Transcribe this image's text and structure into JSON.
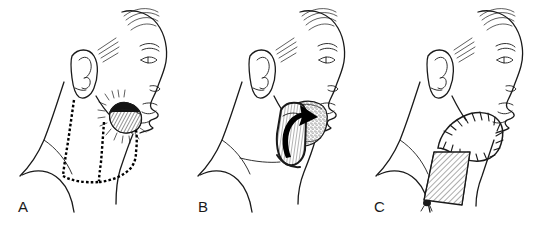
{
  "figure": {
    "type": "line-drawing-surgical-illustration",
    "background_color": "#ffffff",
    "ink_color": "#1a1a1a",
    "width_px": 545,
    "height_px": 236,
    "panel_count": 3,
    "view": "right lateral profile of head and neck"
  },
  "panels": [
    {
      "id": "A",
      "label": "A",
      "label_x": 18,
      "label_y": 212,
      "caption": "Cheek defect with planned cervicofacial flap incision outlined in dashed lines extending preauricularly down the neck",
      "subject": "right lateral profile of head, neck and shoulder",
      "features": [
        "oval shaded cheek defect with radiating hatch marks",
        "dashed incision line from preauricular region down the anterior neck",
        "dashed horizontal limb across the lower neck",
        "dashed vertical limb descending to supraclavicular area",
        "pinna of ear with antihelix and tragus detail",
        "sideburn hair strokes anterior to ear",
        "hairline strokes at vertex",
        "eyebrow, eye, nose and lip profile",
        "shoulder and clavicle contour"
      ],
      "marking_style": "dashed incision lines"
    },
    {
      "id": "B",
      "label": "B",
      "label_x": 198,
      "label_y": 212,
      "caption": "Flap elevated and advanced superiorly; curved arrow indicates direction of flap rotation into the defect",
      "subject": "right lateral profile of head, neck and shoulder",
      "features": [
        "elevated flap with vertical hatching on undersurface",
        "stippled exposed defect bed superiorly",
        "large solid curved arrow directed superoanteriorly",
        "flap raised off the neck leaving open wound margin",
        "pinna of ear with antihelix and tragus detail",
        "sideburn hair strokes anterior to ear",
        "eyebrow, eye, nose and lip profile",
        "shoulder and clavicle contour"
      ],
      "marking_style": "hatched flap, stippled bed, solid advancement arrow"
    },
    {
      "id": "C",
      "label": "C",
      "label_x": 374,
      "label_y": 212,
      "caption": "Final closure with suture line along the cheek and preauricular region; hatched area shows donor site on lateral neck",
      "subject": "right lateral profile of head, neck and shoulder",
      "features": [
        "continuous suture line with cross tick marks along cheek and preauricular border",
        "diagonally hatched quadrilateral donor area on the lateral neck",
        "small suture knot at inferior apex of donor area",
        "pinna of ear with antihelix and tragus detail",
        "sideburn hair strokes anterior to ear",
        "eyebrow, eye, nose and lip profile",
        "shoulder and clavicle contour"
      ],
      "marking_style": "sutured closure with tick marks and hatched donor site"
    }
  ],
  "colors": {
    "background": "#ffffff",
    "ink": "#1a1a1a",
    "incision": "#000000",
    "arrow": "#000000",
    "lesion": "#141414"
  }
}
